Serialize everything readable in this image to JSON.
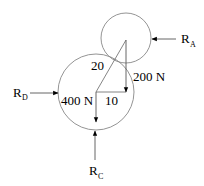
{
  "diagram": {
    "circles": [
      {
        "name": "small-circle",
        "cx": 126,
        "cy": 38,
        "r": 25,
        "stroke": "#777777"
      },
      {
        "name": "large-circle",
        "cx": 96,
        "cy": 92,
        "r": 38,
        "stroke": "#777777"
      }
    ],
    "labels": {
      "hyp": "20",
      "base": "10",
      "force_200": "200 N",
      "force_400": "400 N",
      "ra_main": "R",
      "ra_sub": "A",
      "rd_main": "R",
      "rd_sub": "D",
      "rc_main": "R",
      "rc_sub": "C"
    }
  }
}
